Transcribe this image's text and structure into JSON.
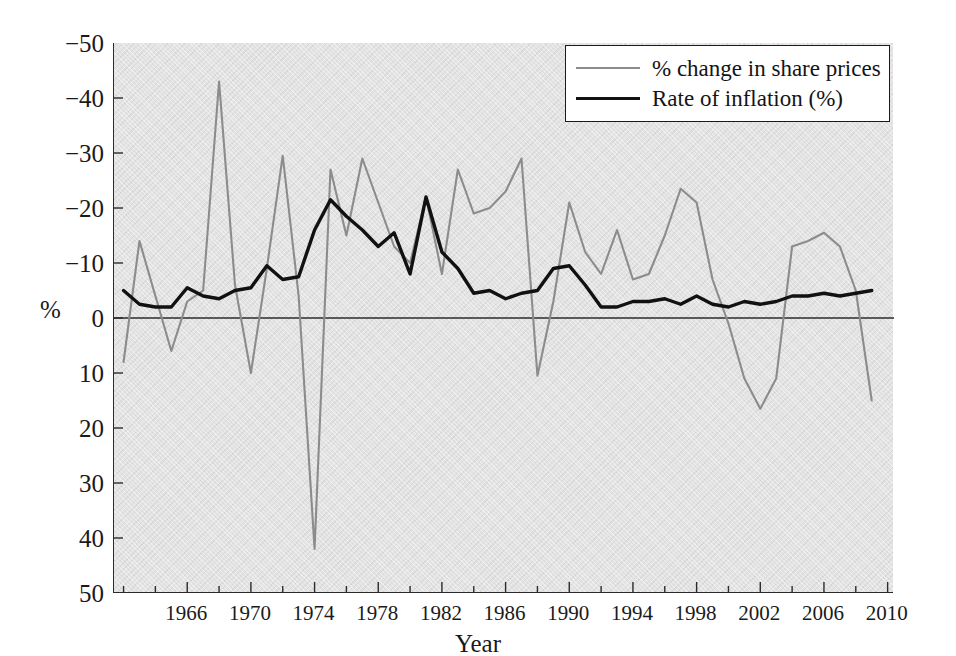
{
  "chart_data": {
    "type": "line",
    "title": "",
    "xlabel": "Year",
    "ylabel": "%",
    "xlim": [
      1961.4,
      2010.4
    ],
    "ylim": [
      -50,
      50
    ],
    "grid": false,
    "legend_position": "top-right",
    "xticks": [
      1966,
      1970,
      1974,
      1978,
      1982,
      1986,
      1990,
      1994,
      1998,
      2002,
      2006,
      2010
    ],
    "xticks_minor_step": 2,
    "yticks": [
      -50,
      -40,
      -30,
      -20,
      -10,
      0,
      10,
      20,
      30,
      40,
      50
    ],
    "zero_line": 0,
    "series": [
      {
        "name": "% change in share prices",
        "color": "#8c8c8c",
        "x": [
          1962,
          1963,
          1964,
          1965,
          1966,
          1967,
          1968,
          1969,
          1970,
          1971,
          1972,
          1973,
          1974,
          1975,
          1976,
          1977,
          1978,
          1979,
          1980,
          1981,
          1982,
          1983,
          1984,
          1985,
          1986,
          1987,
          1988,
          1989,
          1990,
          1991,
          1992,
          1993,
          1994,
          1995,
          1996,
          1997,
          1998,
          1999,
          2000,
          2001,
          2002,
          2003,
          2004,
          2005,
          2006,
          2007,
          2008,
          2009
        ],
        "values": [
          -8,
          14,
          4,
          -6,
          3,
          5,
          43,
          6,
          -10,
          9,
          29.5,
          4,
          -42,
          27,
          15,
          29,
          21,
          13,
          10,
          22,
          8,
          27,
          19,
          20,
          23,
          29,
          -10.5,
          3,
          21,
          12,
          8,
          16,
          7,
          8,
          15,
          23.5,
          21,
          7,
          -1,
          -11,
          -16.5,
          -11,
          13,
          14,
          15.5,
          13,
          5,
          -15
        ]
      },
      {
        "name": "Rate of inflation (%)",
        "color": "#111111",
        "x": [
          1962,
          1963,
          1964,
          1965,
          1966,
          1967,
          1968,
          1969,
          1970,
          1971,
          1972,
          1973,
          1974,
          1975,
          1976,
          1977,
          1978,
          1979,
          1980,
          1981,
          1982,
          1983,
          1984,
          1985,
          1986,
          1987,
          1988,
          1989,
          1990,
          1991,
          1992,
          1993,
          1994,
          1995,
          1996,
          1997,
          1998,
          1999,
          2000,
          2001,
          2002,
          2003,
          2004,
          2005,
          2006,
          2007,
          2008,
          2009
        ],
        "values": [
          5,
          2.5,
          2,
          2,
          5.5,
          4,
          3.5,
          5,
          5.5,
          9.5,
          7,
          7.5,
          16,
          21.5,
          18.5,
          16,
          13,
          15.5,
          8,
          22,
          12,
          9,
          4.5,
          5,
          3.5,
          4.5,
          5,
          9,
          9.5,
          6,
          2,
          2,
          3,
          3,
          3.5,
          2.5,
          4,
          2.5,
          2,
          3,
          2.5,
          3,
          4,
          4,
          4.5,
          4,
          4.5,
          5
        ]
      }
    ]
  },
  "axes": {
    "y_title": "%",
    "x_title": "Year",
    "y_tick_labels": [
      "50",
      "40",
      "30",
      "20",
      "10",
      "0",
      "−10",
      "−20",
      "−30",
      "−40",
      "−50"
    ],
    "x_tick_labels": [
      "1966",
      "1970",
      "1974",
      "1978",
      "1982",
      "1986",
      "1990",
      "1994",
      "1998",
      "2002",
      "2006",
      "2010"
    ]
  },
  "legend": {
    "items": [
      {
        "label": "% change in share prices",
        "color": "#8c8c8c",
        "style": "thin-grey-line"
      },
      {
        "label": "Rate of inflation (%)",
        "color": "#111111",
        "style": "thick-black-line"
      }
    ]
  },
  "colors": {
    "panel_background": "#e3e3e3",
    "axis": "#2b2b2b",
    "share_prices_line": "#8c8c8c",
    "inflation_line": "#111111",
    "text": "#1a1a1a"
  }
}
